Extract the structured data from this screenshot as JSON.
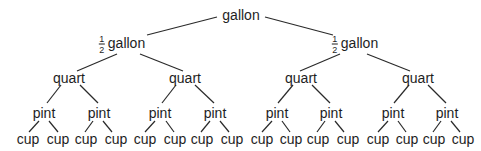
{
  "diagram": {
    "type": "tree",
    "title": "",
    "root": {
      "label": "gallon",
      "children": [
        {
          "label": "gallon",
          "fraction": {
            "numerator": "1",
            "denominator": "2"
          },
          "children": [
            {
              "label": "quart",
              "children": [
                {
                  "label": "pint",
                  "children": [
                    {
                      "label": "cup"
                    },
                    {
                      "label": "cup"
                    }
                  ]
                },
                {
                  "label": "pint",
                  "children": [
                    {
                      "label": "cup"
                    },
                    {
                      "label": "cup"
                    }
                  ]
                }
              ]
            },
            {
              "label": "quart",
              "children": [
                {
                  "label": "pint",
                  "children": [
                    {
                      "label": "cup"
                    },
                    {
                      "label": "cup"
                    }
                  ]
                },
                {
                  "label": "pint",
                  "children": [
                    {
                      "label": "cup"
                    },
                    {
                      "label": "cup"
                    }
                  ]
                }
              ]
            }
          ]
        },
        {
          "label": "gallon",
          "fraction": {
            "numerator": "1",
            "denominator": "2"
          },
          "children": [
            {
              "label": "quart",
              "children": [
                {
                  "label": "pint",
                  "children": [
                    {
                      "label": "cup"
                    },
                    {
                      "label": "cup"
                    }
                  ]
                },
                {
                  "label": "pint",
                  "children": [
                    {
                      "label": "cup"
                    },
                    {
                      "label": "cup"
                    }
                  ]
                }
              ]
            },
            {
              "label": "quart",
              "children": [
                {
                  "label": "pint",
                  "children": [
                    {
                      "label": "cup"
                    },
                    {
                      "label": "cup"
                    }
                  ]
                },
                {
                  "label": "pint",
                  "children": [
                    {
                      "label": "cup"
                    },
                    {
                      "label": "cup"
                    }
                  ]
                }
              ]
            }
          ]
        }
      ]
    }
  },
  "labels": {
    "gallon": "gallon",
    "half_numerator": "1",
    "half_denominator": "2",
    "half_gallon": "gallon",
    "quart": "quart",
    "pint": "pint",
    "cup": "cup"
  },
  "colors": {
    "line": "#2a2a2a",
    "text": "#1e1e1e",
    "background": "#ffffff"
  }
}
